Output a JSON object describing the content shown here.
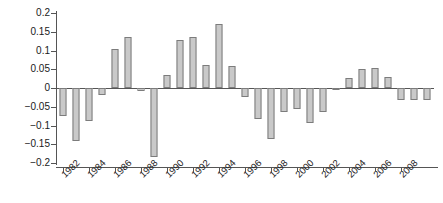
{
  "chart_data": {
    "type": "bar",
    "title": "",
    "subtitle": "",
    "xlabel": "",
    "ylabel": "",
    "ylim": [
      -0.2,
      0.2
    ],
    "xlim": [
      1981.5,
      2010.5
    ],
    "grid": false,
    "legend": null,
    "y_ticks": [
      0.2,
      0.15,
      0.1,
      0.05,
      0,
      -0.05,
      -0.1,
      -0.15,
      -0.2
    ],
    "y_tick_labels": [
      "0.2",
      "0.15",
      "0.1",
      "0.05",
      "0",
      "−0.05",
      "−0.1",
      "−0.15",
      "−0.2"
    ],
    "x_ticks": [
      1982,
      1984,
      1986,
      1988,
      1990,
      1992,
      1994,
      1996,
      1998,
      2000,
      2002,
      2004,
      2006,
      2008
    ],
    "x_tick_labels": [
      "1982",
      "1984",
      "1986",
      "1988",
      "1990",
      "1992",
      "1994",
      "1996",
      "1998",
      "2000",
      "2002",
      "2004",
      "2006",
      "2008"
    ],
    "bar_fill_color": "#c9c9c9",
    "bar_edge_color": "#7c7c7c",
    "axis_color": "#555555",
    "categories": [
      1982,
      1983,
      1984,
      1985,
      1986,
      1987,
      1988,
      1989,
      1990,
      1991,
      1992,
      1993,
      1994,
      1995,
      1996,
      1997,
      1998,
      1999,
      2000,
      2001,
      2002,
      2003,
      2004,
      2005,
      2006,
      2007,
      2008,
      2009,
      2010
    ],
    "values": [
      -0.075,
      -0.142,
      -0.087,
      -0.018,
      0.105,
      0.137,
      -0.008,
      -0.185,
      0.035,
      0.128,
      0.136,
      0.062,
      0.17,
      0.058,
      -0.025,
      -0.082,
      -0.137,
      -0.063,
      -0.055,
      -0.093,
      -0.065,
      -0.002,
      0.028,
      0.051,
      0.054,
      0.03,
      -0.033,
      -0.031,
      -0.031
    ]
  }
}
